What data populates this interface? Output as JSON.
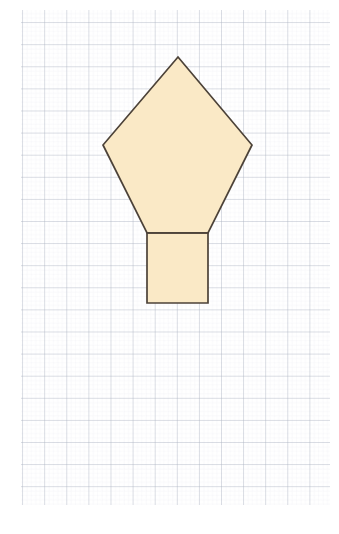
{
  "figure": {
    "canvas": {
      "width": 339,
      "height": 534,
      "background": "#ffffff"
    },
    "grid": {
      "label": "graph-paper-grid",
      "minor_spacing": 4.42,
      "major_spacing": 22.1,
      "origin_x": 21,
      "origin_y": 10,
      "extent_x": 330,
      "extent_y": 505,
      "minor_color": "#e9ecf2",
      "major_color": "#aab2c0",
      "minor_width": 0.5,
      "major_width": 0.8,
      "visible": true
    },
    "style": {
      "fill_color": "#fae9c6",
      "stroke_color": "#4c4238",
      "stroke_width": 1.7,
      "fill_opacity": 1
    },
    "shapes": [
      {
        "name": "pentagon",
        "kind": "polygon",
        "vertices": [
          [
            178,
            57
          ],
          [
            252,
            145
          ],
          [
            208,
            233
          ],
          [
            147,
            233
          ],
          [
            103,
            145
          ]
        ]
      },
      {
        "name": "rectangle-stem",
        "kind": "polygon",
        "vertices": [
          [
            147,
            233
          ],
          [
            208,
            233
          ],
          [
            208,
            303
          ],
          [
            147,
            303
          ]
        ]
      }
    ],
    "outline_path": "M 178 57 L 252 145 L 208 233 L 208 303 L 147 303 L 147 233 L 103 145 Z",
    "internal_segment": {
      "name": "pentagon-base-line",
      "x1": 147,
      "y1": 233,
      "x2": 208,
      "y2": 233
    }
  }
}
